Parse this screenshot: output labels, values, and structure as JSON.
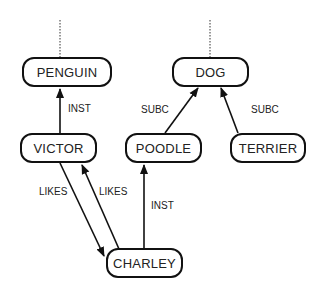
{
  "diagram": {
    "type": "semantic-network",
    "nodes": [
      {
        "id": "penguin",
        "label": "PENGUIN",
        "x": 22,
        "y": 57,
        "w": 90,
        "h": 30
      },
      {
        "id": "dog",
        "label": "DOG",
        "x": 172,
        "y": 57,
        "w": 77,
        "h": 30
      },
      {
        "id": "victor",
        "label": "VICTOR",
        "x": 20,
        "y": 133,
        "w": 77,
        "h": 30
      },
      {
        "id": "poodle",
        "label": "POODLE",
        "x": 125,
        "y": 133,
        "w": 77,
        "h": 30
      },
      {
        "id": "terrier",
        "label": "TERRIER",
        "x": 230,
        "y": 133,
        "w": 76,
        "h": 30
      },
      {
        "id": "charley",
        "label": "CHARLEY",
        "x": 106,
        "y": 248,
        "w": 77,
        "h": 30
      }
    ],
    "edges": [
      {
        "from": "victor",
        "to": "penguin",
        "label": "INST"
      },
      {
        "from": "poodle",
        "to": "dog",
        "label": "SUBC"
      },
      {
        "from": "terrier",
        "to": "dog",
        "label": "SUBC"
      },
      {
        "from": "victor",
        "to": "charley",
        "label": "LIKES"
      },
      {
        "from": "charley",
        "to": "victor",
        "label": "LIKES"
      },
      {
        "from": "charley",
        "to": "poodle",
        "label": "INST"
      }
    ],
    "edge_labels": {
      "inst_victor_penguin": "INST",
      "subc_poodle_dog": "SUBC",
      "subc_terrier_dog": "SUBC",
      "likes_victor_charley": "LIKES",
      "likes_charley_victor": "LIKES",
      "inst_charley_poodle": "INST"
    },
    "continuation_lines": [
      "penguin",
      "dog"
    ]
  }
}
